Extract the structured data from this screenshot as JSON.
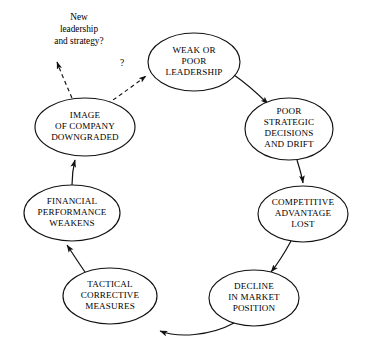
{
  "diagram": {
    "type": "cycle-diagram",
    "colors": {
      "background": "#ffffff",
      "stroke": "#111111",
      "text": "#000000"
    },
    "nodes": [
      {
        "id": "weak-or-poor-leadership",
        "lines": [
          "WEAK OR",
          "POOR",
          "LEADERSHIP"
        ],
        "cx": 194,
        "cy": 62,
        "rx": 46,
        "ry": 29
      },
      {
        "id": "poor-strategic-decisions-and-drift",
        "lines": [
          "POOR",
          "STRATEGIC",
          "DECISIONS",
          "AND DRIFT"
        ],
        "cx": 289,
        "cy": 129,
        "rx": 44,
        "ry": 31
      },
      {
        "id": "competitive-advantage-lost",
        "lines": [
          "COMPETITIVE",
          "ADVANTAGE",
          "LOST"
        ],
        "cx": 303,
        "cy": 214,
        "rx": 45,
        "ry": 28
      },
      {
        "id": "decline-in-market-position",
        "lines": [
          "DECLINE",
          "IN MARKET",
          "POSITION"
        ],
        "cx": 254,
        "cy": 298,
        "rx": 45,
        "ry": 28
      },
      {
        "id": "tactical-corrective-measures",
        "lines": [
          "TACTICAL",
          "CORRECTIVE",
          "MEASURES"
        ],
        "cx": 110,
        "cy": 296,
        "rx": 47,
        "ry": 28
      },
      {
        "id": "financial-performance-weakens",
        "lines": [
          "FINANCIAL",
          "PERFORMANCE",
          "WEAKENS"
        ],
        "cx": 72,
        "cy": 213,
        "rx": 48,
        "ry": 28
      },
      {
        "id": "image-of-company-downgraded",
        "lines": [
          "IMAGE",
          "OF COMPANY",
          "DOWNGRADED"
        ],
        "cx": 85,
        "cy": 127,
        "rx": 50,
        "ry": 29
      }
    ],
    "annotations": [
      {
        "id": "new-leadership-and-strategy",
        "lines": [
          "New",
          "leadership",
          "and strategy?"
        ],
        "x": 79,
        "y": 16
      },
      {
        "id": "question-mark-label",
        "text": "?",
        "x": 122,
        "y": 63
      }
    ],
    "edges": [
      {
        "id": "edge-leadership-to-strategic",
        "style": "solid",
        "from": "weak-or-poor-leadership",
        "to": "poor-strategic-decisions-and-drift"
      },
      {
        "id": "edge-strategic-to-competitive",
        "style": "solid",
        "from": "poor-strategic-decisions-and-drift",
        "to": "competitive-advantage-lost"
      },
      {
        "id": "edge-competitive-to-decline",
        "style": "solid",
        "from": "competitive-advantage-lost",
        "to": "decline-in-market-position"
      },
      {
        "id": "edge-decline-to-tactical",
        "style": "solid",
        "from": "decline-in-market-position",
        "to": "tactical-corrective-measures"
      },
      {
        "id": "edge-tactical-to-financial",
        "style": "solid",
        "from": "tactical-corrective-measures",
        "to": "financial-performance-weakens"
      },
      {
        "id": "edge-financial-to-image",
        "style": "solid",
        "from": "financial-performance-weakens",
        "to": "image-of-company-downgraded"
      },
      {
        "id": "edge-image-to-leadership",
        "style": "dashed",
        "from": "image-of-company-downgraded",
        "to": "weak-or-poor-leadership"
      },
      {
        "id": "edge-image-to-new-leadership",
        "style": "dashed",
        "from": "image-of-company-downgraded",
        "to": "new-leadership-and-strategy"
      }
    ]
  }
}
